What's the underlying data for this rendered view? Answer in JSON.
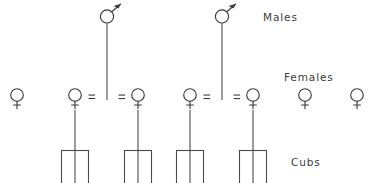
{
  "diagram": {
    "background_color": "#ffffff",
    "stroke_color": "#3c3c3c",
    "line_color": "#4a4a4a",
    "width": 380,
    "height": 183
  },
  "tier_labels": {
    "males": "Males",
    "females": "Females",
    "cubs": "Cubs"
  },
  "label_positions": {
    "males": {
      "x": 263,
      "y": 21
    },
    "females": {
      "x": 284,
      "y": 81
    },
    "cubs": {
      "x": 291,
      "y": 166
    }
  },
  "males": [
    {
      "id": "male-1",
      "symbol": "mars",
      "x": 107,
      "y": 15,
      "descent_line": {
        "from_y": 24,
        "to_y": 100
      }
    },
    {
      "id": "male-2",
      "symbol": "mars",
      "x": 222,
      "y": 15,
      "descent_line": {
        "from_y": 24,
        "to_y": 100
      }
    }
  ],
  "females": [
    {
      "id": "female-1",
      "symbol": "venus",
      "x": 17,
      "y": 97,
      "mated": false,
      "has_offspring": false
    },
    {
      "id": "female-2",
      "symbol": "venus",
      "x": 75,
      "y": 97,
      "mated": true,
      "has_offspring": true
    },
    {
      "id": "female-3",
      "symbol": "venus",
      "x": 138,
      "y": 97,
      "mated": true,
      "has_offspring": true
    },
    {
      "id": "female-4",
      "symbol": "venus",
      "x": 190,
      "y": 97,
      "mated": true,
      "has_offspring": true
    },
    {
      "id": "female-5",
      "symbol": "venus",
      "x": 253,
      "y": 97,
      "mated": true,
      "has_offspring": true
    },
    {
      "id": "female-6",
      "symbol": "venus",
      "x": 305,
      "y": 97,
      "mated": false,
      "has_offspring": false
    },
    {
      "id": "female-7",
      "symbol": "venus",
      "x": 357,
      "y": 97,
      "mated": false,
      "has_offspring": false
    }
  ],
  "unions": [
    {
      "id": "union-1",
      "male": "male-1",
      "female": "female-2",
      "marker": "=",
      "x": 92,
      "y": 97
    },
    {
      "id": "union-2",
      "male": "male-1",
      "female": "female-3",
      "marker": "=",
      "x": 122,
      "y": 97
    },
    {
      "id": "union-3",
      "male": "male-2",
      "female": "female-4",
      "marker": "=",
      "x": 207,
      "y": 97
    },
    {
      "id": "union-4",
      "male": "male-2",
      "female": "female-5",
      "marker": "=",
      "x": 237,
      "y": 97
    }
  ],
  "litters": [
    {
      "id": "litter-1",
      "parent": "female-2",
      "center_x": 75,
      "drop_from_y": 107,
      "sibship_y": 150,
      "left_x": 61,
      "right_x": 89,
      "cub_count": 3,
      "cub_bottom_y": 183
    },
    {
      "id": "litter-2",
      "parent": "female-3",
      "center_x": 138,
      "drop_from_y": 107,
      "sibship_y": 150,
      "left_x": 124,
      "right_x": 152,
      "cub_count": 3,
      "cub_bottom_y": 183
    },
    {
      "id": "litter-3",
      "parent": "female-4",
      "center_x": 190,
      "drop_from_y": 107,
      "sibship_y": 150,
      "left_x": 176,
      "right_x": 204,
      "cub_count": 3,
      "cub_bottom_y": 183
    },
    {
      "id": "litter-4",
      "parent": "female-5",
      "center_x": 253,
      "drop_from_y": 107,
      "sibship_y": 150,
      "left_x": 239,
      "right_x": 267,
      "cub_count": 3,
      "cub_bottom_y": 183
    }
  ],
  "counts": {
    "males_total": 2,
    "females_total": 7,
    "unions_total": 4,
    "litters_total": 4,
    "cubs_total": 12
  }
}
